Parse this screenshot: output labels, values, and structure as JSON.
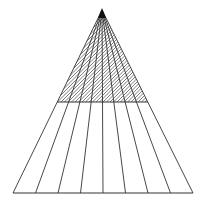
{
  "diagram": {
    "type": "triangle-fan-perspective",
    "width": 208,
    "height": 207,
    "background": "#ffffff",
    "stroke_color": "#333333",
    "apex": [
      102,
      10
    ],
    "base_left": [
      13,
      193
    ],
    "base_right": [
      193,
      193
    ],
    "base_divisions": 8,
    "horizon_y": 102,
    "hatch": {
      "region": "upper",
      "angle_deg": 45,
      "spacing": 3.5,
      "color": "#444444"
    }
  }
}
